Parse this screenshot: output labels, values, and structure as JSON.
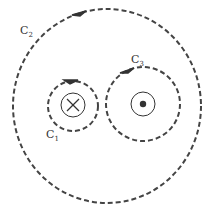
{
  "diagram": {
    "colors": {
      "line": "#444444",
      "background": "#ffffff"
    },
    "loops": [
      {
        "id": "C1",
        "label": "C",
        "subscript": "1",
        "cx": 73,
        "cy": 106,
        "r": 25,
        "style": "dashed",
        "direction": "clockwise-arrow-top"
      },
      {
        "id": "C2",
        "label": "C",
        "subscript": "2",
        "cx": 107,
        "cy": 106,
        "r": 96,
        "style": "dashed",
        "direction": "clockwise-arrow-top"
      },
      {
        "id": "C3",
        "label": "C",
        "subscript": "3",
        "cx": 143,
        "cy": 104,
        "r": 37,
        "style": "dashed",
        "direction": "clockwise-arrow-top"
      }
    ],
    "wires": [
      {
        "id": "wire-into-page",
        "symbol": "cross",
        "meaning": "current into page",
        "cx": 73,
        "cy": 105,
        "r": 12
      },
      {
        "id": "wire-out-of-page",
        "symbol": "dot",
        "meaning": "current out of page",
        "cx": 143,
        "cy": 104,
        "r": 12
      }
    ]
  }
}
